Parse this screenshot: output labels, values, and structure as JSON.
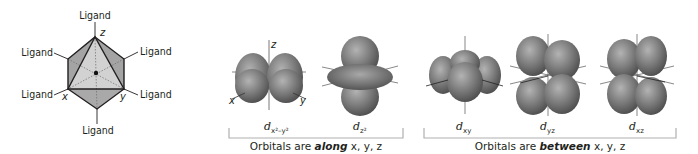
{
  "octahedron": {
    "ligand_label": "Ligand",
    "ligands": [
      {
        "position": "top",
        "label": "Ligand"
      },
      {
        "position": "upper-left",
        "label": "Ligand"
      },
      {
        "position": "upper-right",
        "label": "Ligand"
      },
      {
        "position": "lower-left",
        "label": "Ligand"
      },
      {
        "position": "lower-right",
        "label": "Ligand"
      },
      {
        "position": "bottom",
        "label": "Ligand"
      }
    ],
    "axes": {
      "z": "z",
      "x": "x",
      "y": "y"
    },
    "colors": {
      "face_dark": "#9d9d9d",
      "face_light": "#c9c9c9",
      "edge": "#231f20"
    }
  },
  "orbitals": [
    {
      "id": "dx2-y2",
      "name": "d",
      "sub": "x²–y²",
      "group": "along",
      "axes": {
        "z": "z",
        "x": "x",
        "y": "y"
      }
    },
    {
      "id": "dz2",
      "name": "d",
      "sub": "z²",
      "group": "along"
    },
    {
      "id": "dxy",
      "name": "d",
      "sub": "xy",
      "group": "between"
    },
    {
      "id": "dyz",
      "name": "d",
      "sub": "yz",
      "group": "between"
    },
    {
      "id": "dxz",
      "name": "d",
      "sub": "xz",
      "group": "between"
    }
  ],
  "groups": {
    "along": {
      "prefix": "Orbitals are ",
      "emphasis": "along",
      "suffix": " x, y, z"
    },
    "between": {
      "prefix": "Orbitals are ",
      "emphasis": "between",
      "suffix": " x, y, z"
    }
  },
  "colors": {
    "lobe_dark": "#4a4a4a",
    "lobe_mid": "#7a7a7a",
    "lobe_light": "#b3b3b3",
    "bracket": "#b0b0b0",
    "text": "#231f20"
  }
}
